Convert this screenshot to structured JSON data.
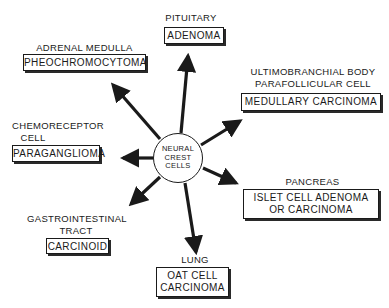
{
  "center": {
    "lines": [
      "NEURAL",
      "CREST",
      "CELLS"
    ]
  },
  "nodes": [
    {
      "id": "pituitary",
      "source_lines": [
        "PITUITARY"
      ],
      "tumor_lines": [
        "ADENOMA"
      ]
    },
    {
      "id": "adrenal",
      "source_lines": [
        "ADRENAL MEDULLA"
      ],
      "tumor_lines": [
        "PHEOCHROMOCYTOMA"
      ]
    },
    {
      "id": "ultimobranchial",
      "source_lines": [
        "ULTIMOBRANCHIAL BODY",
        "PARAFOLLICULAR CELL"
      ],
      "tumor_lines": [
        "MEDULLARY CARCINOMA"
      ]
    },
    {
      "id": "chemoreceptor",
      "source_lines": [
        "CHEMORECEPTOR",
        "CELL"
      ],
      "tumor_lines": [
        "PARAGANGLIOMA"
      ]
    },
    {
      "id": "pancreas",
      "source_lines": [
        "PANCREAS"
      ],
      "tumor_lines": [
        "ISLET CELL ADENOMA",
        "OR CARCINOMA"
      ]
    },
    {
      "id": "gastrointestinal",
      "source_lines": [
        "GASTROINTESTINAL",
        "TRACT"
      ],
      "tumor_lines": [
        "CARCINOID"
      ]
    },
    {
      "id": "lung",
      "source_lines": [
        "LUNG"
      ],
      "tumor_lines": [
        "OAT CELL",
        "CARCINOMA"
      ]
    }
  ],
  "colors": {
    "ink": "#1a1a1a",
    "background": "#ffffff"
  }
}
